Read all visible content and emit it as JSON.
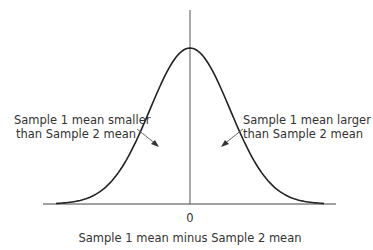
{
  "chart_data": {
    "type": "line",
    "title": "",
    "xlabel": "Sample 1 mean minus Sample 2 mean",
    "ylabel": "",
    "x_ticks": [
      "0"
    ],
    "series": [
      {
        "name": "normal distribution",
        "mean": 0,
        "shape": "bell curve"
      }
    ],
    "annotations": [
      {
        "text": "Sample 1 mean smaller than Sample 2 mean",
        "side": "left",
        "arrow_to": "left half under curve"
      },
      {
        "text": "Sample 1 mean larger than Sample 2 mean",
        "side": "right",
        "arrow_to": "right half under curve"
      }
    ],
    "grid": false,
    "legend": "none"
  },
  "labels": {
    "left_line1": "Sample 1 mean smaller",
    "left_line2": "than Sample 2 mean",
    "right_line1": "Sample 1 mean larger",
    "right_line2": "than Sample 2 mean",
    "zero_tick": "0",
    "xlabel": "Sample 1 mean minus Sample 2 mean"
  },
  "colors": {
    "line": "#222222",
    "axis": "#444444",
    "arrow": "#555555"
  }
}
